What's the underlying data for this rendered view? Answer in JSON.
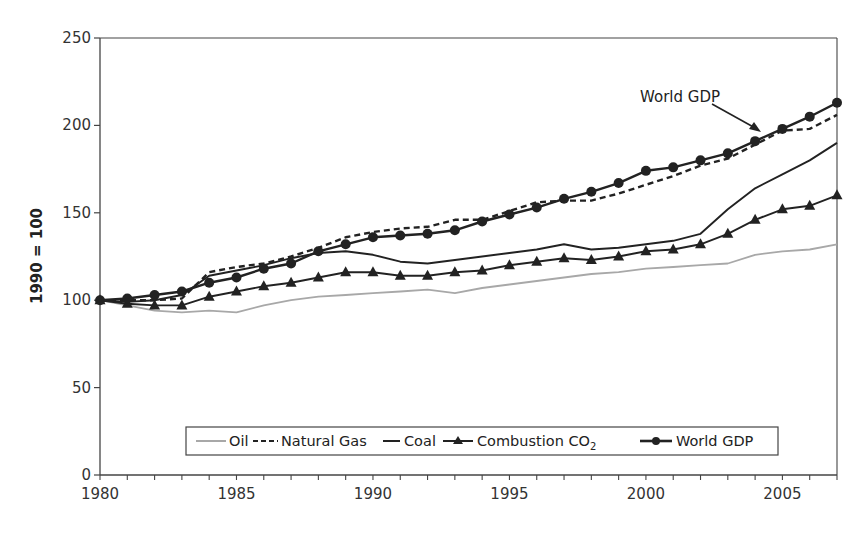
{
  "chart_data": {
    "type": "line",
    "title": "",
    "xlabel": "",
    "ylabel": "1990 = 100",
    "xlim": [
      1980,
      2007
    ],
    "ylim": [
      0,
      250
    ],
    "grid": false,
    "legend_position": "bottom-inside",
    "x_ticks": [
      1980,
      1985,
      1990,
      1995,
      2000,
      2005
    ],
    "y_ticks": [
      0,
      50,
      100,
      150,
      200,
      250
    ],
    "x": [
      1980,
      1981,
      1982,
      1983,
      1984,
      1985,
      1986,
      1987,
      1988,
      1989,
      1990,
      1991,
      1992,
      1993,
      1994,
      1995,
      1996,
      1997,
      1998,
      1999,
      2000,
      2001,
      2002,
      2003,
      2004,
      2005,
      2006,
      2007
    ],
    "series": [
      {
        "name": "Oil",
        "style": "solid-gray",
        "marker": "none",
        "values": [
          100,
          97,
          94,
          93,
          94,
          93,
          97,
          100,
          102,
          103,
          104,
          105,
          106,
          104,
          107,
          109,
          111,
          113,
          115,
          116,
          118,
          119,
          120,
          121,
          126,
          128,
          129,
          132
        ]
      },
      {
        "name": "Natural Gas",
        "style": "dashed",
        "marker": "none",
        "values": [
          100,
          100,
          100,
          101,
          116,
          119,
          121,
          125,
          130,
          136,
          139,
          141,
          142,
          146,
          146,
          151,
          156,
          157,
          157,
          161,
          166,
          171,
          177,
          181,
          189,
          197,
          198,
          206
        ]
      },
      {
        "name": "Coal",
        "style": "solid",
        "marker": "none",
        "values": [
          100,
          99,
          100,
          103,
          114,
          117,
          120,
          124,
          127,
          128,
          126,
          122,
          121,
          123,
          125,
          127,
          129,
          132,
          129,
          130,
          132,
          134,
          138,
          152,
          164,
          172,
          180,
          190
        ]
      },
      {
        "name": "Combustion CO2",
        "style": "solid",
        "marker": "triangle",
        "values": [
          100,
          98,
          97,
          97,
          102,
          105,
          108,
          110,
          113,
          116,
          116,
          114,
          114,
          116,
          117,
          120,
          122,
          124,
          123,
          125,
          128,
          129,
          132,
          138,
          146,
          152,
          154,
          160
        ]
      },
      {
        "name": "World GDP",
        "style": "solid-thick",
        "marker": "circle",
        "values": [
          100,
          101,
          103,
          105,
          110,
          113,
          118,
          121,
          128,
          132,
          136,
          137,
          138,
          140,
          145,
          149,
          153,
          158,
          162,
          167,
          174,
          176,
          180,
          184,
          191,
          198,
          205,
          213
        ]
      }
    ],
    "annotations": [
      {
        "text": "World GDP",
        "arrow_to_year": 2004,
        "arrow_to_value": 191
      }
    ]
  },
  "legend": {
    "items": [
      {
        "label": "Oil"
      },
      {
        "label": "Natural Gas"
      },
      {
        "label": "Coal"
      },
      {
        "label": "Combustion CO",
        "sub": "2"
      },
      {
        "label": "World GDP"
      }
    ]
  },
  "axis": {
    "y_title": "1990 = 100"
  },
  "annotation": {
    "text": "World GDP"
  },
  "colors": {
    "oil": "#a8a8a8",
    "line": "#222222",
    "axis": "#444444"
  }
}
